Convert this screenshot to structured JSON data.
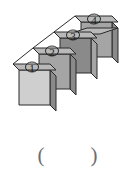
{
  "figure": {
    "projection": "oblique",
    "cube_count": 4,
    "cubes": [
      {
        "label": "①",
        "number": 1,
        "position": "front-bottom-left"
      },
      {
        "label": "②",
        "number": 2,
        "position": "second"
      },
      {
        "label": "③",
        "number": 3,
        "position": "third"
      },
      {
        "label": "④",
        "number": 4,
        "position": "back-top-right"
      }
    ],
    "colors": {
      "top_face": "#b9b9b9",
      "front_face": "#cfcfcf",
      "side_face_dark": "#8a8a8a",
      "side_face_mid": "#a5a5a5",
      "outline": "#2b2b2b",
      "label_text": "#1a1a1a",
      "background": "#ffffff"
    }
  },
  "answer": {
    "open_paren": "(",
    "close_paren": ")",
    "value": "",
    "placeholder": ""
  }
}
